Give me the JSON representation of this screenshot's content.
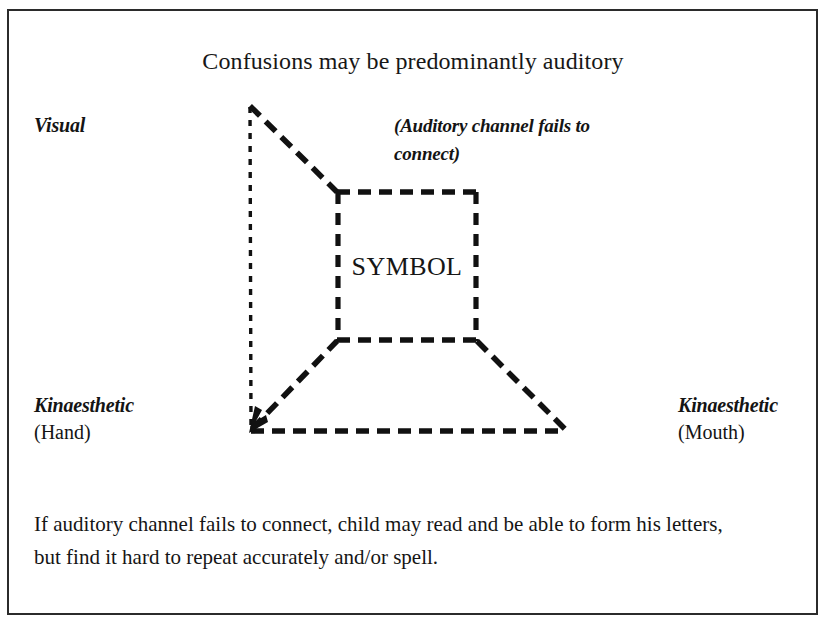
{
  "figure": {
    "title": "Confusions may be predominantly auditory",
    "caption": "If auditory channel fails to connect, child may read and be able to form his letters, but find it hard to repeat accurately and/or spell.",
    "border_color": "#2b2b2b",
    "line_color": "#111111",
    "background": "#ffffff"
  },
  "labels": {
    "visual": {
      "term": "Visual",
      "qualifier": ""
    },
    "auditory_note": "(Auditory channel fails to connect)",
    "kinaesthetic_hand": {
      "term": "Kinaesthetic",
      "qualifier": "(Hand)"
    },
    "kinaesthetic_mouth": {
      "term": "Kinaesthetic",
      "qualifier": "(Mouth)"
    },
    "symbol": "SYMBOL"
  },
  "diagram": {
    "type": "perspective-box",
    "vertices": {
      "visual_top_left": [
        249,
        105
      ],
      "kinaesthetic_hand_bottom_left": [
        251,
        431
      ],
      "kinaesthetic_mouth_bottom_right": [
        565,
        431
      ],
      "symbol_top_left": [
        337,
        192
      ],
      "symbol_top_right": [
        477,
        192
      ],
      "symbol_bottom_left": [
        337,
        340
      ],
      "symbol_bottom_right": [
        477,
        340
      ]
    },
    "edges": [
      {
        "name": "visual-vertical",
        "from": "visual_top_left",
        "to": "kinaesthetic_hand_bottom_left",
        "style": "fine-dashed"
      },
      {
        "name": "visual-to-symbol",
        "from": "visual_top_left",
        "to": "symbol_top_left",
        "style": "bold-dashed"
      },
      {
        "name": "hand-to-symbol",
        "from": "kinaesthetic_hand_bottom_left",
        "to": "symbol_bottom_left",
        "style": "bold-dashed"
      },
      {
        "name": "mouth-to-symbol",
        "from": "kinaesthetic_mouth_bottom_right",
        "to": "symbol_bottom_right",
        "style": "bold-dashed"
      },
      {
        "name": "baseline",
        "from": "kinaesthetic_hand_bottom_left",
        "to": "kinaesthetic_mouth_bottom_right",
        "style": "bold-dashed"
      },
      {
        "name": "symbol-top",
        "from": "symbol_top_left",
        "to": "symbol_top_right",
        "style": "bold-dashed"
      },
      {
        "name": "symbol-left",
        "from": "symbol_top_left",
        "to": "symbol_bottom_left",
        "style": "bold-dashed"
      },
      {
        "name": "symbol-right",
        "from": "symbol_top_right",
        "to": "symbol_bottom_right",
        "style": "bold-dashed"
      },
      {
        "name": "symbol-bottom",
        "from": "symbol_bottom_left",
        "to": "symbol_bottom_right",
        "style": "bold-dashed"
      }
    ],
    "missing_edge": {
      "name": "auditory-to-symbol",
      "note": "Upper-right diagonal absent — the auditory channel does not connect"
    },
    "arrowhead": {
      "at": "kinaesthetic_hand_bottom_left",
      "direction": "down-left"
    }
  }
}
